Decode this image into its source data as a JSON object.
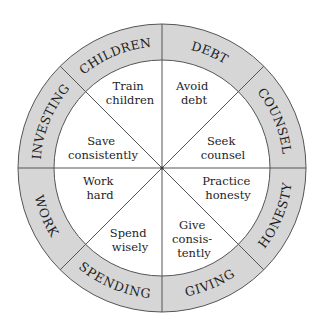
{
  "diagram": {
    "type": "wheel",
    "colors": {
      "ring_fill": "#d6d6d6",
      "line": "#555555",
      "text": "#1e1e1e",
      "background": "#ffffff"
    },
    "ring_labels": {
      "children": "CHILDREN",
      "debt": "DEBT",
      "counsel": "COUNSEL",
      "honesty": "HONESTY",
      "giving": "GIVING",
      "spending": "SPENDING",
      "work": "WORK",
      "investing": "INVESTING"
    },
    "segments": {
      "children": [
        "Train",
        "children"
      ],
      "debt": [
        "Avoid",
        "debt"
      ],
      "counsel": [
        "Seek",
        "counsel"
      ],
      "honesty": [
        "Practice",
        "honesty"
      ],
      "giving": [
        "Give",
        "consis-",
        "tently"
      ],
      "spending": [
        "Spend",
        "wisely"
      ],
      "work": [
        "Work",
        "hard"
      ],
      "investing": [
        "Save",
        "consistently"
      ]
    }
  }
}
